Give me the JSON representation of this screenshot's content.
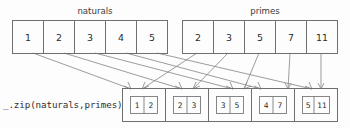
{
  "diagram": {
    "title_left": "naturals",
    "title_right": "primes",
    "operation_label": "_.zip(naturals,primes)",
    "colors": {
      "background": "#fdfdfd",
      "stroke": "#6f6f6f",
      "arrow": "#8a8a8a",
      "text": "#2b2b2b"
    },
    "arrays": [
      {
        "name": "naturals",
        "values": [
          "1",
          "2",
          "3",
          "4",
          "5"
        ]
      },
      {
        "name": "primes",
        "values": [
          "2",
          "3",
          "5",
          "7",
          "11"
        ]
      }
    ],
    "result": {
      "label": "_.zip(naturals,primes)",
      "pairs": [
        {
          "left": "1",
          "right": "2"
        },
        {
          "left": "2",
          "right": "3"
        },
        {
          "left": "3",
          "right": "5"
        },
        {
          "left": "4",
          "right": "7"
        },
        {
          "left": "5",
          "right": "11"
        }
      ]
    }
  }
}
